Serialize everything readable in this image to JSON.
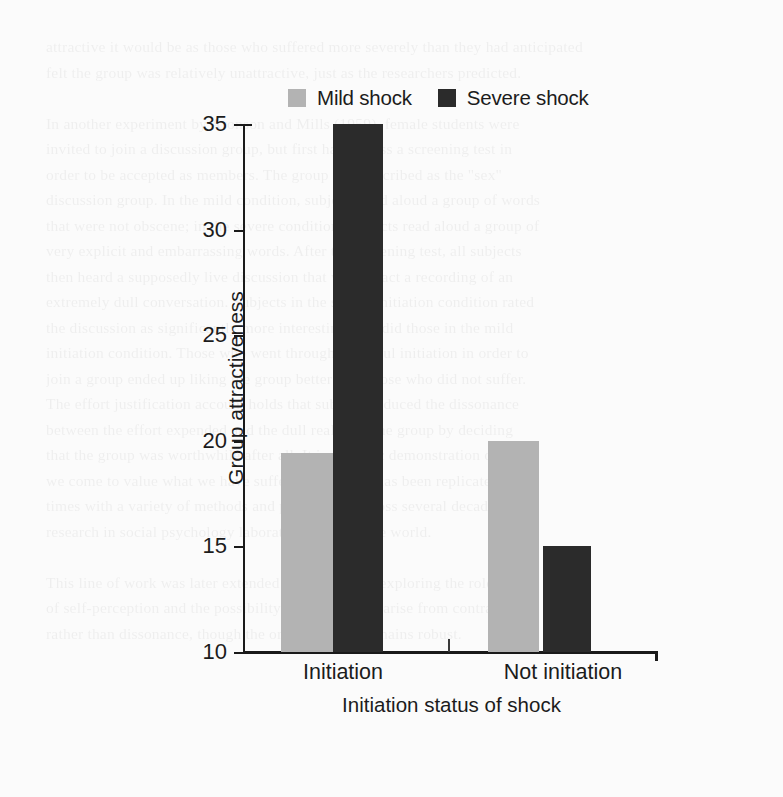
{
  "chart_data": {
    "type": "bar",
    "title": "",
    "xlabel": "Initiation status of shock",
    "ylabel": "Group attractiveness",
    "categories": [
      "Initiation",
      "Not initiation"
    ],
    "series": [
      {
        "name": "Mild shock",
        "values": [
          19.4,
          20.0
        ],
        "color": "#b3b3b3"
      },
      {
        "name": "Severe shock",
        "values": [
          35.0,
          15.0
        ],
        "color": "#2b2b2b"
      }
    ],
    "ylim": [
      10,
      35
    ],
    "yticks": [
      10,
      15,
      20,
      25,
      30,
      35
    ],
    "ytick_labels": [
      "10",
      "15",
      "20",
      "25",
      "30",
      "35"
    ],
    "grid": false,
    "legend_position": "top-center"
  },
  "legend": {
    "items": [
      {
        "label": "Mild shock",
        "color": "#b3b3b3"
      },
      {
        "label": "Severe shock",
        "color": "#2b2b2b"
      }
    ]
  },
  "axes": {
    "y_title": "Group attractiveness",
    "x_title": "Initiation status of shock",
    "y_ticks": [
      "35",
      "30",
      "25",
      "20",
      "15",
      "10"
    ],
    "x_categories": [
      "Initiation",
      "Not initiation"
    ]
  },
  "background_text": {
    "lines": [
      "attractive it would be as those who suffered more severely than they had anticipated",
      "felt the group was relatively unattractive, just as the researchers predicted.",
      "",
      "In another experiment by Aronson and Mills (1959), female students were",
      "invited to join a discussion group, but first had to pass a screening test in",
      "order to be accepted as members. The group was described as the \"sex\"",
      "discussion group. In the mild condition, subjects read aloud a group of words",
      "that were not obscene; in the severe condition, subjects read aloud a group of",
      "very explicit and embarrassing words. After the screening test, all subjects",
      "then heard a supposedly live discussion that was in fact a recording of an",
      "extremely dull conversation. Subjects in the severe initiation condition rated",
      "the discussion as significantly more interesting than did those in the mild",
      "initiation condition. Those who went through a painful initiation in order to",
      "join a group ended up liking the group better than those who did not suffer.",
      "The effort justification account holds that subjects reduced the dissonance",
      "between the effort expended and the dull reality of the group by deciding",
      "that the group was worthwhile after all. It is a classic demonstration of how",
      "we come to value what we have suffered for, and it has been replicated many",
      "times with a variety of methods and populations across several decades of",
      "research in social psychology laboratories around the world.",
      "",
      "This line of work was later extended by researchers exploring the role",
      "of self-perception and the possibility that the effects arise from contrast",
      "rather than dissonance, though the original effect remains robust."
    ]
  }
}
